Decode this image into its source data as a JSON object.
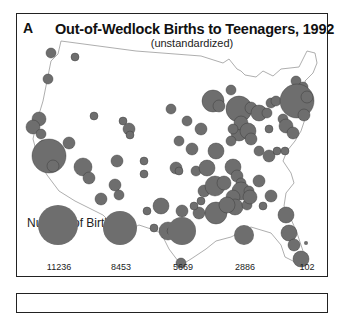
{
  "panel": {
    "letter": "A",
    "title": "Out-of-Wedlock Births to Teenagers, 1992",
    "subtitle": "(unstandardized)"
  },
  "legend": {
    "title": "Number of Births",
    "items": [
      {
        "label": "11236",
        "r": 20,
        "cx": 57
      },
      {
        "label": "8453",
        "r": 17,
        "cx": 119
      },
      {
        "label": "5669",
        "r": 14,
        "cx": 181
      },
      {
        "label": "2886",
        "r": 10,
        "cx": 243
      },
      {
        "label": "102",
        "r": 2,
        "cx": 305
      }
    ]
  },
  "colors": {
    "bubble": "#6e6e6e",
    "outline": "#888888",
    "frame": "#222222"
  },
  "bubbles": [
    [
      50,
      52,
      5
    ],
    [
      74,
      56,
      4
    ],
    [
      47,
      78,
      5
    ],
    [
      38,
      118,
      7
    ],
    [
      32,
      126,
      7
    ],
    [
      40,
      133,
      5
    ],
    [
      43,
      145,
      6
    ],
    [
      44,
      157,
      7
    ],
    [
      48,
      155,
      17
    ],
    [
      52,
      165,
      6
    ],
    [
      68,
      142,
      6
    ],
    [
      93,
      115,
      4
    ],
    [
      128,
      128,
      6
    ],
    [
      129,
      134,
      4
    ],
    [
      116,
      160,
      6
    ],
    [
      143,
      160,
      4
    ],
    [
      143,
      173,
      4
    ],
    [
      82,
      166,
      9
    ],
    [
      88,
      177,
      6
    ],
    [
      114,
      184,
      6
    ],
    [
      170,
      108,
      5
    ],
    [
      186,
      120,
      5
    ],
    [
      178,
      140,
      5
    ],
    [
      191,
      148,
      6
    ],
    [
      175,
      167,
      6
    ],
    [
      178,
      170,
      4
    ],
    [
      200,
      128,
      6
    ],
    [
      215,
      150,
      8
    ],
    [
      238,
      132,
      8
    ],
    [
      212,
      100,
      11
    ],
    [
      218,
      105,
      6
    ],
    [
      238,
      108,
      13
    ],
    [
      250,
      107,
      6
    ],
    [
      258,
      112,
      8
    ],
    [
      240,
      122,
      7
    ],
    [
      232,
      128,
      5
    ],
    [
      247,
      130,
      8
    ],
    [
      230,
      140,
      5
    ],
    [
      250,
      138,
      6
    ],
    [
      258,
      150,
      5
    ],
    [
      266,
      112,
      5
    ],
    [
      270,
      102,
      5
    ],
    [
      230,
      89,
      5
    ],
    [
      275,
      100,
      5
    ],
    [
      287,
      97,
      4
    ],
    [
      295,
      80,
      5
    ],
    [
      302,
      86,
      5
    ],
    [
      296,
      100,
      17
    ],
    [
      306,
      96,
      6
    ],
    [
      303,
      114,
      6
    ],
    [
      282,
      118,
      5
    ],
    [
      285,
      125,
      7
    ],
    [
      292,
      132,
      6
    ],
    [
      268,
      155,
      6
    ],
    [
      276,
      150,
      4
    ],
    [
      284,
      150,
      4
    ],
    [
      232,
      166,
      8
    ],
    [
      236,
      175,
      6
    ],
    [
      240,
      182,
      5
    ],
    [
      240,
      190,
      9
    ],
    [
      232,
      196,
      7
    ],
    [
      248,
      190,
      5
    ],
    [
      258,
      180,
      6
    ],
    [
      234,
      206,
      8
    ],
    [
      246,
      204,
      5
    ],
    [
      195,
      170,
      5
    ],
    [
      206,
      167,
      8
    ],
    [
      203,
      190,
      6
    ],
    [
      214,
      185,
      10
    ],
    [
      223,
      182,
      7
    ],
    [
      198,
      212,
      6
    ],
    [
      215,
      212,
      11
    ],
    [
      226,
      204,
      8
    ],
    [
      249,
      196,
      7
    ],
    [
      262,
      205,
      4
    ],
    [
      270,
      195,
      6
    ],
    [
      285,
      214,
      8
    ],
    [
      288,
      232,
      8
    ],
    [
      293,
      244,
      6
    ],
    [
      300,
      258,
      8
    ],
    [
      181,
      210,
      6
    ],
    [
      160,
      205,
      8
    ],
    [
      146,
      210,
      4
    ],
    [
      167,
      230,
      9
    ],
    [
      153,
      227,
      4
    ],
    [
      170,
      230,
      4
    ],
    [
      180,
      262,
      5
    ],
    [
      193,
      205,
      4
    ],
    [
      122,
      120,
      4
    ],
    [
      200,
      200,
      4
    ],
    [
      268,
      128,
      4
    ],
    [
      118,
      194,
      5
    ],
    [
      100,
      198,
      6
    ]
  ]
}
